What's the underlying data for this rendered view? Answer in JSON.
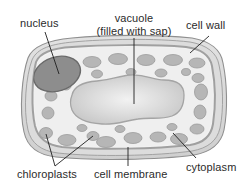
{
  "diagram": {
    "style": "grayscale line drawing"
  },
  "labels": {
    "nucleus": "nucleus",
    "vacuole_line1": "vacuole",
    "vacuole_line2": "(filled with sap)",
    "cell_wall": "cell wall",
    "chloroplasts": "chloroplasts",
    "cell_membrane": "cell membrane",
    "cytoplasm": "cytoplasm"
  },
  "colors": {
    "background": "#ffffff",
    "text": "#2b2b2b",
    "leader_line": "#1f1f1f",
    "cell_wall_outer": "#d9d9d9",
    "cell_wall_mid": "#c2c2c2",
    "cell_membrane": "#a8a8a8",
    "cytoplasm": "#eeeeee",
    "chloroplast": "#b4b4b4",
    "chloroplast_stroke": "#9a9a9a",
    "nucleus_fill": "#8d8d8d",
    "nucleus_stroke": "#6e6e6e",
    "vacuole_fill": "#c8c8c8",
    "vacuole_center": "#f0f0f0",
    "vacuole_stroke": "#a6a6a6"
  },
  "structures": {
    "nucleus": {
      "cx": 57,
      "cy": 74,
      "rx": 24,
      "ry": 17,
      "rotation": -18
    },
    "vacuole": {
      "center_x": 128,
      "center_y": 104
    },
    "chloroplast_count": 26
  },
  "leaders": {
    "nucleus": {
      "x1": 45,
      "y1": 32,
      "x2": 59,
      "y2": 74
    },
    "vacuole": {
      "x1": 134,
      "y1": 38,
      "x2": 134,
      "y2": 104
    },
    "cell_wall": {
      "x1": 209,
      "y1": 36,
      "x2": 190,
      "y2": 53
    },
    "cell_membrane": {
      "x1": 128,
      "y1": 166,
      "x2": 128,
      "y2": 147
    },
    "cytoplasm": {
      "x1": 196,
      "y1": 158,
      "x2": 173,
      "y2": 133
    },
    "chloroplast_a": {
      "x1": 55,
      "y1": 166,
      "x2": 46,
      "y2": 134
    },
    "chloroplast_b": {
      "x1": 55,
      "y1": 166,
      "x2": 93,
      "y2": 136
    }
  }
}
